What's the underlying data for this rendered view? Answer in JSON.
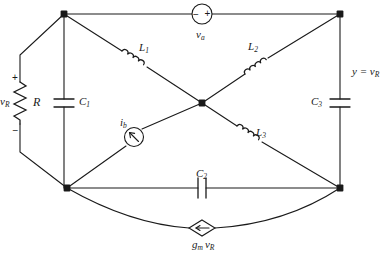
{
  "diagram": {
    "type": "circuit-schematic",
    "stroke_color": "#1a1a1a",
    "background_color": "#ffffff",
    "nodes": [
      {
        "id": "top-left",
        "x": 64,
        "y": 14
      },
      {
        "id": "top-right",
        "x": 340,
        "y": 14
      },
      {
        "id": "center",
        "x": 202,
        "y": 103
      },
      {
        "id": "bottom-left",
        "x": 67,
        "y": 188
      },
      {
        "id": "bottom-right",
        "x": 340,
        "y": 188
      },
      {
        "id": "left-mid-upper",
        "x": 20,
        "y": 55
      },
      {
        "id": "left-mid-lower",
        "x": 20,
        "y": 152
      }
    ],
    "components": [
      {
        "id": "va",
        "kind": "voltage-source",
        "label": "v",
        "sublabel": "a",
        "polarity_left": "−",
        "polarity_right": "+",
        "x": 202,
        "y": 14
      },
      {
        "id": "R",
        "kind": "resistor",
        "label": "R",
        "sublabel": "",
        "terminal_label": "v",
        "terminal_sublabel": "R",
        "plus": "+",
        "minus": "−",
        "x": 28,
        "y": 103
      },
      {
        "id": "C1",
        "kind": "capacitor",
        "label": "C",
        "sublabel": "1",
        "x": 81,
        "y": 103
      },
      {
        "id": "C3",
        "kind": "capacitor",
        "label": "C",
        "sublabel": "3",
        "x": 340,
        "y": 103
      },
      {
        "id": "C2",
        "kind": "capacitor",
        "label": "C",
        "sublabel": "2",
        "x": 202,
        "y": 188
      },
      {
        "id": "L1",
        "kind": "inductor",
        "label": "L",
        "sublabel": "1"
      },
      {
        "id": "L2",
        "kind": "inductor",
        "label": "L",
        "sublabel": "2"
      },
      {
        "id": "L3",
        "kind": "inductor",
        "label": "L",
        "sublabel": "3"
      },
      {
        "id": "ib",
        "kind": "current-source",
        "label": "i",
        "sublabel": "b",
        "x": 134,
        "y": 137
      },
      {
        "id": "gmvr",
        "kind": "dependent-current-source",
        "label": "g",
        "sublabel": "m",
        "label2": "v",
        "sublabel2": "R",
        "x": 202,
        "y": 228
      }
    ],
    "annotations": [
      {
        "id": "output",
        "text_prefix": "y = v",
        "text_sub": "R",
        "x": 352,
        "y": 67
      }
    ],
    "labels": {
      "va": "v",
      "va_sub": "a",
      "va_minus": "−",
      "va_plus": "+",
      "vR": "v",
      "vR_sub": "R",
      "R": "R",
      "R_plus": "+",
      "R_minus": "−",
      "C1": "C",
      "C1_sub": "1",
      "C2": "C",
      "C2_sub": "2",
      "C3": "C",
      "C3_sub": "3",
      "L1": "L",
      "L1_sub": "1",
      "L2": "L",
      "L2_sub": "2",
      "L3": "L",
      "L3_sub": "3",
      "ib": "i",
      "ib_sub": "b",
      "gm": "g",
      "gm_sub": "m",
      "gm_v": "v",
      "gm_v_sub": "R",
      "output_eq": "y = v",
      "output_sub": "R"
    }
  }
}
